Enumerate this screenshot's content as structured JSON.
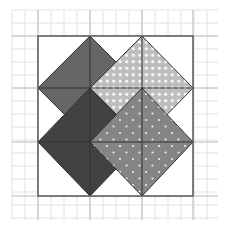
{
  "figure": {
    "title": "",
    "width": 225,
    "height": 229
  },
  "grid": {
    "x0": 12,
    "y0": 10,
    "x1": 218,
    "y1": 220,
    "minor_step": 13,
    "minor_color": "#e2e2e2",
    "major_color": "#cfcfcf",
    "major_x": [
      38,
      90,
      142,
      193
    ],
    "major_y": [
      36,
      88,
      142,
      196
    ]
  },
  "frame": {
    "x": 38,
    "y": 36,
    "width": 155,
    "height": 160,
    "stroke": "#555555"
  },
  "inner_lines": {
    "vertical": [
      90,
      142
    ],
    "horizontal": [
      88,
      142
    ],
    "stroke": "#333333"
  },
  "shapes": [
    {
      "name": "mid-gray-diamond",
      "fill": "#666666",
      "pattern": "none",
      "points": "90,36 142,88 90,140 38,88"
    },
    {
      "name": "dark-gray-diamond",
      "fill": "#424242",
      "pattern": "none",
      "points": "90,88 142,142 90,196 38,142"
    },
    {
      "name": "light-dotted-diamond",
      "fill": "#bdbdbd",
      "pattern": "dense-white-dots",
      "points": "142,36 193,88 142,140 90,88"
    },
    {
      "name": "medium-dotted-diamond",
      "fill": "#858585",
      "pattern": "sparse-white-dots",
      "points": "142,88 193,142 142,196 90,142"
    }
  ],
  "colors": {
    "background": "#ffffff",
    "mid_gray": "#666666",
    "dark_gray": "#424242",
    "light_gray": "#bdbdbd",
    "medium_gray": "#858585",
    "dot": "#ffffff"
  }
}
